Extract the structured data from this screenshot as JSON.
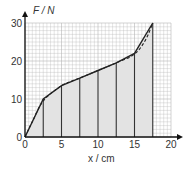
{
  "chart_data": {
    "type": "area",
    "title": "",
    "xlabel": "x / cm",
    "ylabel": "F / N",
    "xlim": [
      0,
      20
    ],
    "ylim": [
      0,
      30
    ],
    "x_ticks": [
      0,
      5,
      10,
      15,
      20
    ],
    "y_ticks": [
      0,
      10,
      20,
      30
    ],
    "x_tick_labels": [
      "0",
      "5",
      "10",
      "15",
      "20"
    ],
    "y_tick_labels": [
      "0",
      "10",
      "20",
      "30"
    ],
    "grid": true,
    "series": [
      {
        "name": "piecewise linear approximation (solid)",
        "style": "solid",
        "x": [
          0,
          2.5,
          5,
          7.5,
          10,
          12.5,
          15,
          17.5
        ],
        "y": [
          0,
          10,
          13.5,
          15.5,
          17.5,
          19.5,
          22,
          30
        ]
      },
      {
        "name": "force-extension curve (dashed)",
        "style": "dashed",
        "x": [
          0,
          1,
          2.5,
          5,
          7.5,
          10,
          12.5,
          15,
          16.5,
          17.5
        ],
        "y": [
          0,
          4,
          9.5,
          13.5,
          15.5,
          17.5,
          19.5,
          21.8,
          25.5,
          30
        ]
      }
    ],
    "strips": {
      "description": "shaded area under curve divided into trapezoid strips of width 2.5 cm",
      "boundaries_x": [
        2.5,
        5,
        7.5,
        10,
        12.5,
        15,
        17.5
      ]
    },
    "colors": {
      "fill": "#e3e3e3",
      "grid": "#b5b5b5",
      "line": "#222222"
    }
  }
}
